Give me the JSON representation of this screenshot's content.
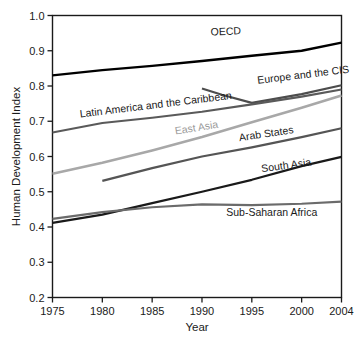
{
  "chart_data": {
    "type": "line",
    "title": "",
    "xlabel": "Year",
    "ylabel": "Human Development Index",
    "xlim": [
      1975,
      2004
    ],
    "ylim": [
      0.2,
      1.0
    ],
    "grid": false,
    "legend_position": "inline-labels",
    "xticks": [
      "1975",
      "1980",
      "1985",
      "1990",
      "1995",
      "2000",
      "2004"
    ],
    "xtick_values": [
      1975,
      1980,
      1985,
      1990,
      1995,
      2000,
      2004
    ],
    "yticks": [
      "0.2",
      "0.3",
      "0.4",
      "0.5",
      "0.6",
      "0.7",
      "0.8",
      "0.9",
      "1.0"
    ],
    "ytick_values": [
      0.2,
      0.3,
      0.4,
      0.5,
      0.6,
      0.7,
      0.8,
      0.9,
      1.0
    ],
    "series": [
      {
        "name": "OECD",
        "color": "#000000",
        "width": 2.4,
        "label_x": 1992.4,
        "label_y": 0.945,
        "label_anchor": "middle",
        "label_rotate": -2.5,
        "x": [
          1975,
          1980,
          1985,
          1990,
          1995,
          2000,
          2004
        ],
        "values": [
          0.83,
          0.845,
          0.857,
          0.871,
          0.886,
          0.9,
          0.923
        ]
      },
      {
        "name": "Europe and the CIS",
        "color": "#4d4d4d",
        "width": 2.2,
        "label_x": 2000.2,
        "label_y": 0.822,
        "label_anchor": "middle",
        "label_rotate": -7,
        "x": [
          1990,
          1992,
          1995,
          2000,
          2004
        ],
        "values": [
          0.793,
          0.775,
          0.752,
          0.777,
          0.802
        ]
      },
      {
        "name": "Latin America and the Caribbean",
        "color": "#5a5a5a",
        "width": 2.2,
        "label_x": 1985.4,
        "label_y": 0.737,
        "label_anchor": "middle",
        "label_rotate": -7,
        "x": [
          1975,
          1980,
          1985,
          1990,
          1995,
          2000,
          2004
        ],
        "values": [
          0.668,
          0.695,
          0.71,
          0.727,
          0.748,
          0.77,
          0.79
        ]
      },
      {
        "name": "East Asia",
        "color": "#a8a8a8",
        "width": 2.6,
        "label_x": 1989.5,
        "label_y": 0.672,
        "label_anchor": "middle",
        "label_rotate": -9,
        "x": [
          1975,
          1980,
          1985,
          1990,
          1995,
          2000,
          2004
        ],
        "values": [
          0.551,
          0.582,
          0.617,
          0.655,
          0.697,
          0.738,
          0.773
        ]
      },
      {
        "name": "Arab States",
        "color": "#555555",
        "width": 2.2,
        "label_x": 1996.5,
        "label_y": 0.655,
        "label_anchor": "middle",
        "label_rotate": -8.5,
        "x": [
          1980,
          1985,
          1990,
          1995,
          2000,
          2004
        ],
        "values": [
          0.531,
          0.567,
          0.6,
          0.626,
          0.655,
          0.68
        ]
      },
      {
        "name": "South Asia",
        "color": "#1a1a1a",
        "width": 2.3,
        "label_x": 1998.5,
        "label_y": 0.565,
        "label_anchor": "middle",
        "label_rotate": -8,
        "x": [
          1975,
          1980,
          1985,
          1990,
          1995,
          2000,
          2004
        ],
        "values": [
          0.412,
          0.435,
          0.468,
          0.5,
          0.534,
          0.573,
          0.599
        ]
      },
      {
        "name": "Sub-Saharan Africa",
        "color": "#6b6b6b",
        "width": 2.2,
        "label_x": 1997.0,
        "label_y": 0.432,
        "label_anchor": "middle",
        "label_rotate": 0,
        "x": [
          1975,
          1980,
          1985,
          1990,
          1995,
          2000,
          2004
        ],
        "values": [
          0.423,
          0.442,
          0.456,
          0.464,
          0.462,
          0.466,
          0.472
        ]
      }
    ]
  }
}
